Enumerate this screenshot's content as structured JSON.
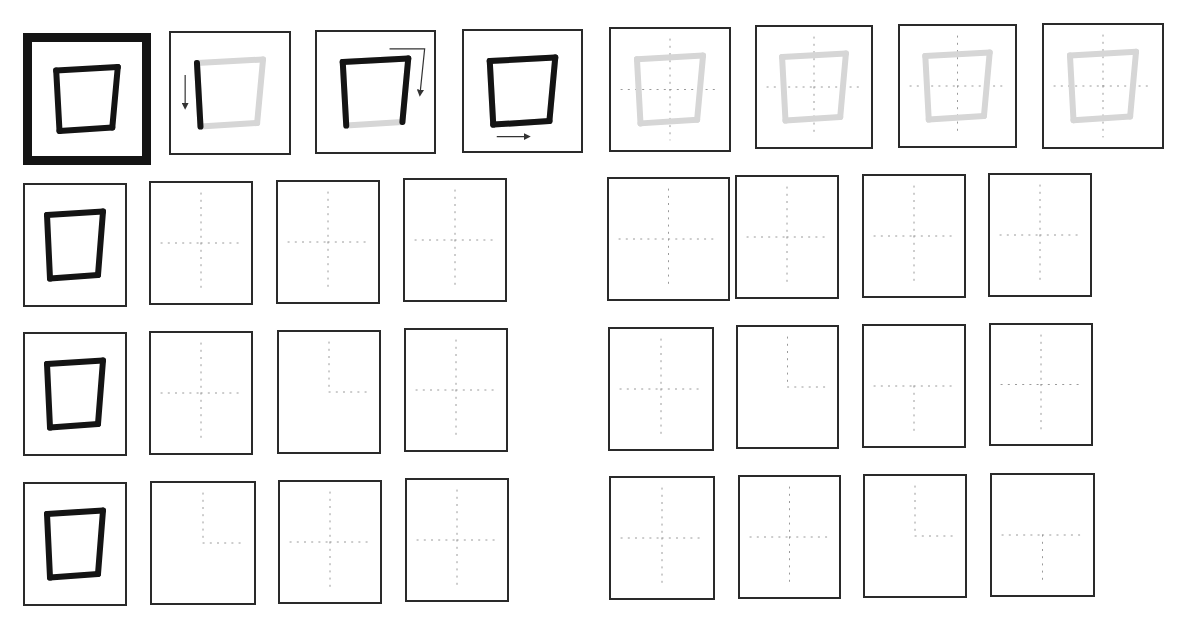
{
  "worksheet": {
    "rows": 4,
    "columns": 8,
    "shape": "quadrilateral",
    "colors": {
      "ink": "#141414",
      "trace": "#d6d6d6",
      "guide": "#9a9a9a",
      "frame": "#2a2a2a"
    },
    "grid": [
      [
        {
          "kind": "model",
          "bold": true,
          "x": 23,
          "y": 33,
          "w": 128,
          "h": 132
        },
        {
          "kind": "stroke",
          "step": 1,
          "x": 169,
          "y": 31,
          "w": 122,
          "h": 124,
          "arrow": "down-left"
        },
        {
          "kind": "stroke",
          "step": 2,
          "x": 315,
          "y": 30,
          "w": 121,
          "h": 124,
          "arrow": "top-right-down"
        },
        {
          "kind": "stroke",
          "step": 3,
          "x": 462,
          "y": 29,
          "w": 121,
          "h": 124,
          "arrow": "bottom-right"
        },
        {
          "kind": "trace",
          "x": 609,
          "y": 27,
          "w": 122,
          "h": 125
        },
        {
          "kind": "trace",
          "x": 755,
          "y": 25,
          "w": 118,
          "h": 124
        },
        {
          "kind": "trace",
          "x": 898,
          "y": 24,
          "w": 119,
          "h": 124
        },
        {
          "kind": "trace",
          "x": 1042,
          "y": 23,
          "w": 122,
          "h": 126
        }
      ],
      [
        {
          "kind": "model",
          "x": 23,
          "y": 183,
          "w": 104,
          "h": 124
        },
        {
          "kind": "blank",
          "guide": "full",
          "x": 149,
          "y": 181,
          "w": 104,
          "h": 124
        },
        {
          "kind": "blank",
          "guide": "full",
          "x": 276,
          "y": 180,
          "w": 104,
          "h": 124
        },
        {
          "kind": "blank",
          "guide": "full",
          "x": 403,
          "y": 178,
          "w": 104,
          "h": 124
        },
        {
          "kind": "blank",
          "guide": "full",
          "x": 607,
          "y": 177,
          "w": 123,
          "h": 124
        },
        {
          "kind": "blank",
          "guide": "full",
          "x": 735,
          "y": 175,
          "w": 104,
          "h": 124
        },
        {
          "kind": "blank",
          "guide": "full",
          "x": 862,
          "y": 174,
          "w": 104,
          "h": 124
        },
        {
          "kind": "blank",
          "guide": "full",
          "x": 988,
          "y": 173,
          "w": 104,
          "h": 124
        }
      ],
      [
        {
          "kind": "model",
          "x": 23,
          "y": 332,
          "w": 104,
          "h": 124
        },
        {
          "kind": "blank",
          "guide": "full",
          "x": 149,
          "y": 331,
          "w": 104,
          "h": 124
        },
        {
          "kind": "blank",
          "guide": "partial-top-right",
          "x": 277,
          "y": 330,
          "w": 104,
          "h": 124
        },
        {
          "kind": "blank",
          "guide": "full",
          "x": 404,
          "y": 328,
          "w": 104,
          "h": 124
        },
        {
          "kind": "blank",
          "guide": "full",
          "x": 608,
          "y": 327,
          "w": 106,
          "h": 124
        },
        {
          "kind": "blank",
          "guide": "partial-top-right",
          "x": 736,
          "y": 325,
          "w": 103,
          "h": 124
        },
        {
          "kind": "blank",
          "guide": "partial-bottom-left",
          "x": 862,
          "y": 324,
          "w": 104,
          "h": 124
        },
        {
          "kind": "blank",
          "guide": "full",
          "x": 989,
          "y": 323,
          "w": 104,
          "h": 123
        }
      ],
      [
        {
          "kind": "model",
          "x": 23,
          "y": 482,
          "w": 104,
          "h": 124
        },
        {
          "kind": "blank",
          "guide": "partial-top-right",
          "x": 150,
          "y": 481,
          "w": 106,
          "h": 124
        },
        {
          "kind": "blank",
          "guide": "full",
          "x": 278,
          "y": 480,
          "w": 104,
          "h": 124
        },
        {
          "kind": "blank",
          "guide": "full",
          "x": 405,
          "y": 478,
          "w": 104,
          "h": 124
        },
        {
          "kind": "blank",
          "guide": "full",
          "x": 609,
          "y": 476,
          "w": 106,
          "h": 124
        },
        {
          "kind": "blank",
          "guide": "full",
          "x": 738,
          "y": 475,
          "w": 103,
          "h": 124
        },
        {
          "kind": "blank",
          "guide": "partial-top-right",
          "x": 863,
          "y": 474,
          "w": 104,
          "h": 124
        },
        {
          "kind": "blank",
          "guide": "partial-bottom",
          "x": 990,
          "y": 473,
          "w": 105,
          "h": 124
        }
      ]
    ]
  }
}
